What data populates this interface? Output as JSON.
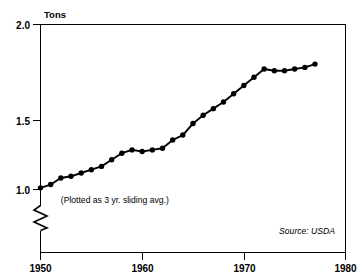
{
  "chart_data": {
    "type": "line",
    "title": "",
    "subtitle": "",
    "xlabel": "",
    "ylabel": "Tons",
    "xlim": [
      1950,
      1980
    ],
    "ylim": [
      0.95,
      2.0
    ],
    "grid": false,
    "legend": "none",
    "y_axis_broken": true,
    "y_break_note": "axis broken below 1.0",
    "xticks": [
      1950,
      1960,
      1970,
      1980
    ],
    "xtick_labels": [
      "1950",
      "1960",
      "1970",
      "1980"
    ],
    "yticks": [
      1.0,
      1.5,
      2.0
    ],
    "ytick_labels": [
      "1.0",
      "1.5",
      "2.0"
    ],
    "annotations": [
      {
        "text": "(Plotted as 3 yr. sliding avg.)",
        "x": 1952.0,
        "y": 0.99
      },
      {
        "text": "Source: USDA",
        "x": 1969.5,
        "y": 0.975
      }
    ],
    "x": [
      1950,
      1951,
      1952,
      1953,
      1954,
      1955,
      1956,
      1957,
      1958,
      1959,
      1960,
      1961,
      1962,
      1963,
      1964,
      1965,
      1966,
      1967,
      1968,
      1969,
      1970,
      1971,
      1972,
      1973,
      1974,
      1975,
      1976,
      1977
    ],
    "values": [
      1.01,
      1.03,
      1.07,
      1.08,
      1.1,
      1.12,
      1.14,
      1.18,
      1.22,
      1.24,
      1.23,
      1.24,
      1.25,
      1.3,
      1.33,
      1.4,
      1.45,
      1.49,
      1.53,
      1.58,
      1.63,
      1.68,
      1.73,
      1.72,
      1.72,
      1.73,
      1.74,
      1.76
    ],
    "series": [
      {
        "name": "Tons",
        "values": [
          1.01,
          1.03,
          1.07,
          1.08,
          1.1,
          1.12,
          1.14,
          1.18,
          1.22,
          1.24,
          1.23,
          1.24,
          1.25,
          1.3,
          1.33,
          1.4,
          1.45,
          1.49,
          1.53,
          1.58,
          1.63,
          1.68,
          1.73,
          1.72,
          1.72,
          1.73,
          1.74,
          1.76
        ]
      }
    ],
    "marker": "filled-circle",
    "line_color": "#000000",
    "marker_color": "#000000",
    "background_color": "#ffffff"
  },
  "axis": {
    "y_title": "Tons",
    "ytick_1": "1.0",
    "ytick_2": "1.5",
    "ytick_3": "2.0",
    "xtick_1": "1950",
    "xtick_2": "1960",
    "xtick_3": "1970",
    "xtick_4": "1980"
  },
  "notes": {
    "method": "(Plotted as 3 yr. sliding avg.)",
    "source": "Source: USDA"
  }
}
